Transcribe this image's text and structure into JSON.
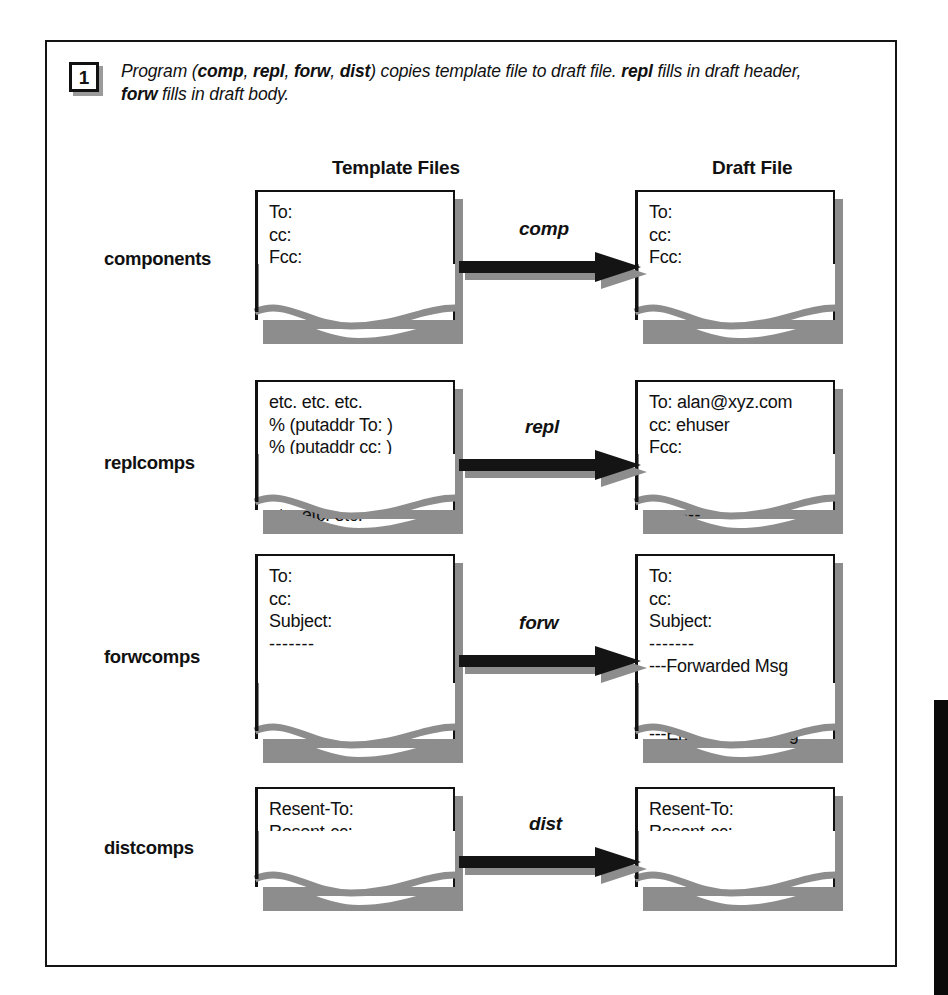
{
  "figure": {
    "step_number": "1",
    "caption_parts": [
      {
        "text": "Program (",
        "bold": false
      },
      {
        "text": "comp",
        "bold": true
      },
      {
        "text": ", ",
        "bold": false
      },
      {
        "text": "repl",
        "bold": true
      },
      {
        "text": ", ",
        "bold": false
      },
      {
        "text": "forw",
        "bold": true
      },
      {
        "text": ", ",
        "bold": false
      },
      {
        "text": "dist",
        "bold": true
      },
      {
        "text": ") copies template file to draft file. ",
        "bold": false
      },
      {
        "text": "repl",
        "bold": true
      },
      {
        "text": " fills in draft header, ",
        "bold": false
      },
      {
        "text": "forw",
        "bold": true
      },
      {
        "text": " fills in draft body.",
        "bold": false
      }
    ],
    "headings": {
      "template_files": "Template Files",
      "draft_file": "Draft File"
    },
    "colors": {
      "ink": "#111111",
      "shadow": "#8d8d8d",
      "paper": "#ffffff"
    }
  },
  "rows": [
    {
      "label": "components",
      "arrow_label": "comp",
      "template_lines": [
        "To:",
        "cc:",
        "Fcc:",
        "Subject:",
        "-------"
      ],
      "draft_lines": [
        "To:",
        "cc:",
        "Fcc:",
        "Subject:",
        "-------"
      ]
    },
    {
      "label": "replcomps",
      "arrow_label": "repl",
      "template_lines": [
        "etc. etc. etc.",
        "% (putaddr To: )",
        "% (putaddr cc: )",
        "Fcc:",
        "%<{subject}",
        "etc. etc. etc."
      ],
      "draft_lines": [
        "To: alan@xyz.com",
        "cc: ehuser",
        "Fcc:",
        "Subject: Re: xx",
        "In-Reply-To:",
        "--------"
      ]
    },
    {
      "label": "forwcomps",
      "arrow_label": "forw",
      "template_lines": [
        "To:",
        "cc:",
        "Subject:",
        "-------"
      ],
      "draft_lines": [
        "To:",
        "cc:",
        "Subject:",
        "-------",
        "---Forwarded Msg",
        "xxx xxx",
        "xxx xxx",
        "---End of Forw Msg"
      ]
    },
    {
      "label": "distcomps",
      "arrow_label": "dist",
      "template_lines": [
        "Resent-To:",
        "Resent-cc:",
        "-------"
      ],
      "draft_lines": [
        "Resent-To:",
        "Resent-cc:",
        "-------"
      ]
    }
  ]
}
